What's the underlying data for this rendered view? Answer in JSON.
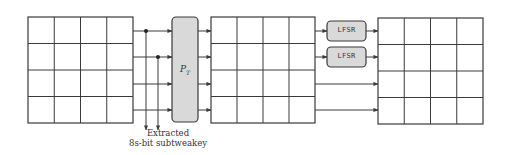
{
  "diagram": {
    "colors": {
      "stroke": "#3a3a3a",
      "box_fill": "#d9d9d9",
      "background": "#ffffff"
    },
    "grids": [
      {
        "name": "state-grid-input",
        "x": 28,
        "y": 17,
        "w": 105,
        "h": 106,
        "rows": 4,
        "cols": 4
      },
      {
        "name": "state-grid-permuted",
        "x": 211,
        "y": 17,
        "w": 104,
        "h": 106,
        "rows": 4,
        "cols": 4
      },
      {
        "name": "state-grid-output",
        "x": 378,
        "y": 18,
        "w": 105,
        "h": 106,
        "rows": 4,
        "cols": 4
      }
    ],
    "permutation_box": {
      "label_main": "P",
      "label_sub": "T",
      "x": 172,
      "y": 17,
      "w": 26,
      "h": 105
    },
    "lfsr_boxes": [
      {
        "label": "LFSR",
        "x": 327,
        "y": 21,
        "w": 39,
        "h": 20
      },
      {
        "label": "LFSR",
        "x": 327,
        "y": 47,
        "w": 39,
        "h": 20
      }
    ],
    "row_y": [
      31,
      57,
      84,
      110
    ],
    "taps": [
      {
        "x": 146,
        "row": 0
      },
      {
        "x": 158,
        "row": 1
      }
    ],
    "caption": {
      "line1": "Extracted",
      "line2": "8s-bit subtweakey"
    }
  }
}
